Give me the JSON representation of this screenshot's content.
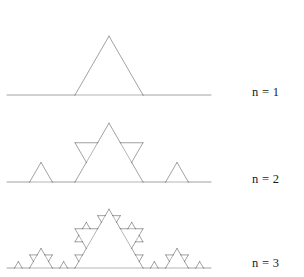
{
  "figure": {
    "type": "fractal-diagram",
    "background_color": "#ffffff",
    "stroke_color": "#555555",
    "canvas": {
      "width": 304,
      "height": 277
    }
  },
  "chart_data": {
    "type": "line",
    "xlabel": "",
    "ylabel": "",
    "grid": false,
    "legend_position": "right",
    "series": [
      {
        "name": "n = 1",
        "iteration": 1,
        "segments": 4,
        "start": [
          7,
          95
        ],
        "end": [
          211,
          95
        ],
        "baseline_y": 95,
        "base_length": 204,
        "apex": [
          109,
          7
        ],
        "construction_lines": 1
      },
      {
        "name": "n = 2",
        "iteration": 2,
        "segments": 16,
        "start": [
          7,
          182
        ],
        "end": [
          211,
          182
        ],
        "baseline_y": 182,
        "base_length": 204,
        "apex": [
          109,
          94
        ],
        "construction_lines": 5
      },
      {
        "name": "n = 3",
        "iteration": 3,
        "segments": 64,
        "start": [
          7,
          268
        ],
        "end": [
          211,
          268
        ],
        "baseline_y": 268,
        "base_length": 204,
        "apex": [
          109,
          180
        ],
        "construction_lines": 21
      }
    ]
  },
  "labels": {
    "n1": "n = 1",
    "n2": "n = 2",
    "n3": "n = 3"
  }
}
